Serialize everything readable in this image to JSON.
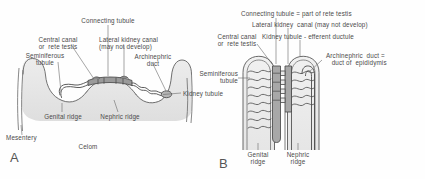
{
  "figure": {
    "type": "anatomical-diagram",
    "background_color": "#fefefe",
    "ink_color": "#4a4a4a",
    "shading_color": "#d8d8d8"
  },
  "panels": [
    {
      "id": "A",
      "letter": "A",
      "caption_labels": {
        "connecting_tubule": "Connecting tubule",
        "central_canal": "Central canal\nor  rete testis",
        "lateral_kidney_canal": "Lateral kidney canal\n(may not develop)",
        "seminiferous_tubule": "Seminiferous\ntubule",
        "archinephric_duct": "Archinephric\nduct",
        "kidney_tubule": "Kidney tubule",
        "genital_ridge": "Genital ridge",
        "nephric_ridge": "Nephric ridge",
        "mesentery": "Mesentery",
        "celom": "Celom"
      }
    },
    {
      "id": "B",
      "letter": "B",
      "caption_labels": {
        "connecting_tubule": "Connecting tubule = part of rete testis",
        "lateral_kidney_canal": "Lateral kidney  canal (may not develop)",
        "kidney_tubule": "Kidney tubule - efferent ductule",
        "central_canal": "Central canal\nor  rete testis",
        "archinephric_duct": "Archinephric  duct =\n   duct of  epididymis",
        "seminiferous_tubule": "Seminiferous\ntubule",
        "genital_ridge": "Genital\nridge",
        "nephric_ridge": "Nephric\nridge"
      }
    }
  ]
}
